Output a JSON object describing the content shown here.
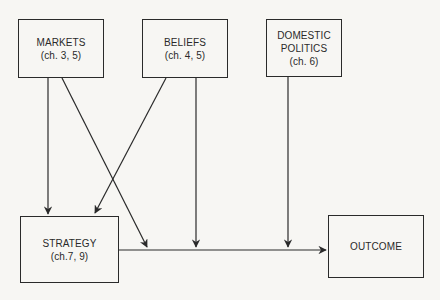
{
  "diagram": {
    "type": "causal-flow",
    "line_color": "#2a2a2a",
    "background": "#f7f6f3",
    "nodes": {
      "markets": {
        "title": "MARKETS",
        "subtitle": "(ch. 3, 5)"
      },
      "beliefs": {
        "title": "BELIEFS",
        "subtitle": "(ch. 4, 5)"
      },
      "domestic_politics": {
        "title_line1": "DOMESTIC",
        "title_line2": "POLITICS",
        "subtitle": "(ch. 6)"
      },
      "strategy": {
        "title": "STRATEGY",
        "subtitle": "(ch.7, 9)"
      },
      "outcome": {
        "title": "OUTCOME"
      }
    },
    "edges": [
      {
        "from": "MARKETS",
        "to": "STRATEGY"
      },
      {
        "from": "MARKETS",
        "to": "STRATEGY→OUTCOME link"
      },
      {
        "from": "BELIEFS",
        "to": "STRATEGY"
      },
      {
        "from": "BELIEFS",
        "to": "STRATEGY→OUTCOME link"
      },
      {
        "from": "DOMESTIC POLITICS",
        "to": "STRATEGY→OUTCOME link"
      },
      {
        "from": "STRATEGY",
        "to": "OUTCOME"
      }
    ]
  }
}
